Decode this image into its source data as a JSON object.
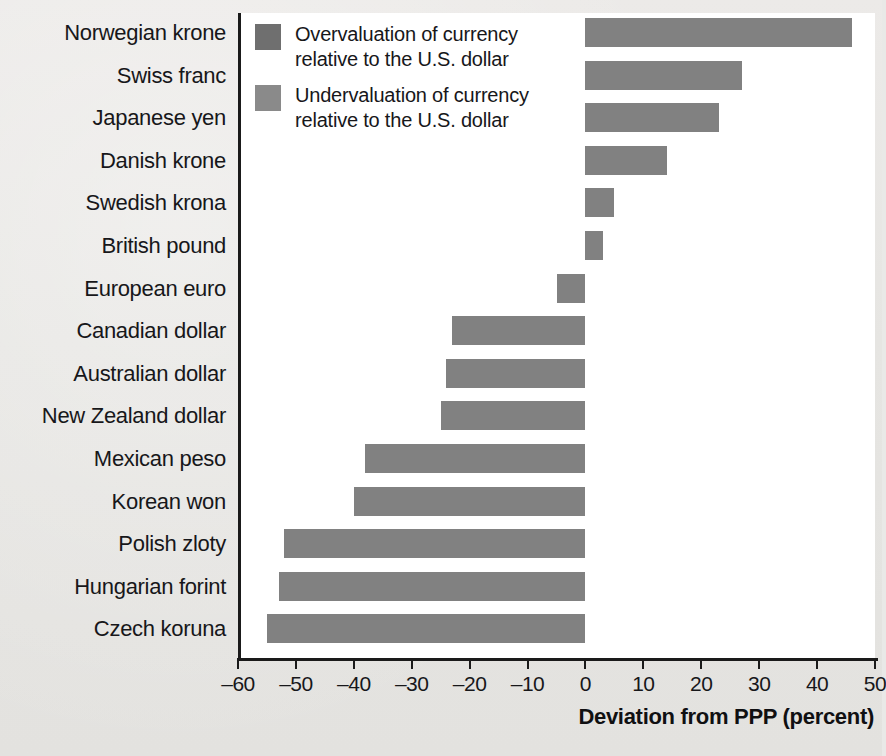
{
  "legend": {
    "items": [
      {
        "swatch_color": "#6f6f6f",
        "line1": "Overvaluation of currency",
        "line2": "relative to the U.S. dollar"
      },
      {
        "swatch_color": "#8a8a8a",
        "line1": "Undervaluation of currency",
        "line2": "relative to the U.S. dollar"
      }
    ]
  },
  "axis": {
    "title": "Deviation from PPP (percent)",
    "tick_labels": [
      "–60",
      "–50",
      "–40",
      "–30",
      "–20",
      "–10",
      "0",
      "10",
      "20",
      "30",
      "40",
      "50"
    ]
  },
  "chart_data": {
    "type": "bar",
    "orientation": "horizontal",
    "title": "",
    "xlabel": "Deviation from PPP (percent)",
    "ylabel": "",
    "xlim": [
      -60,
      50
    ],
    "xticks": [
      -60,
      -50,
      -40,
      -30,
      -20,
      -10,
      0,
      10,
      20,
      30,
      40,
      50
    ],
    "grid": false,
    "bar_color": "#818181",
    "categories": [
      "Norwegian krone",
      "Swiss franc",
      "Japanese yen",
      "Danish krone",
      "Swedish krona",
      "British pound",
      "European euro",
      "Canadian dollar",
      "Australian dollar",
      "New Zealand dollar",
      "Mexican peso",
      "Korean won",
      "Polish zloty",
      "Hungarian forint",
      "Czech koruna"
    ],
    "values": [
      46,
      27,
      23,
      14,
      5,
      3,
      -5,
      -23,
      -24,
      -25,
      -38,
      -40,
      -52,
      -53,
      -55
    ],
    "legend": [
      "Overvaluation of currency relative to the U.S. dollar",
      "Undervaluation of currency relative to the U.S. dollar"
    ]
  }
}
